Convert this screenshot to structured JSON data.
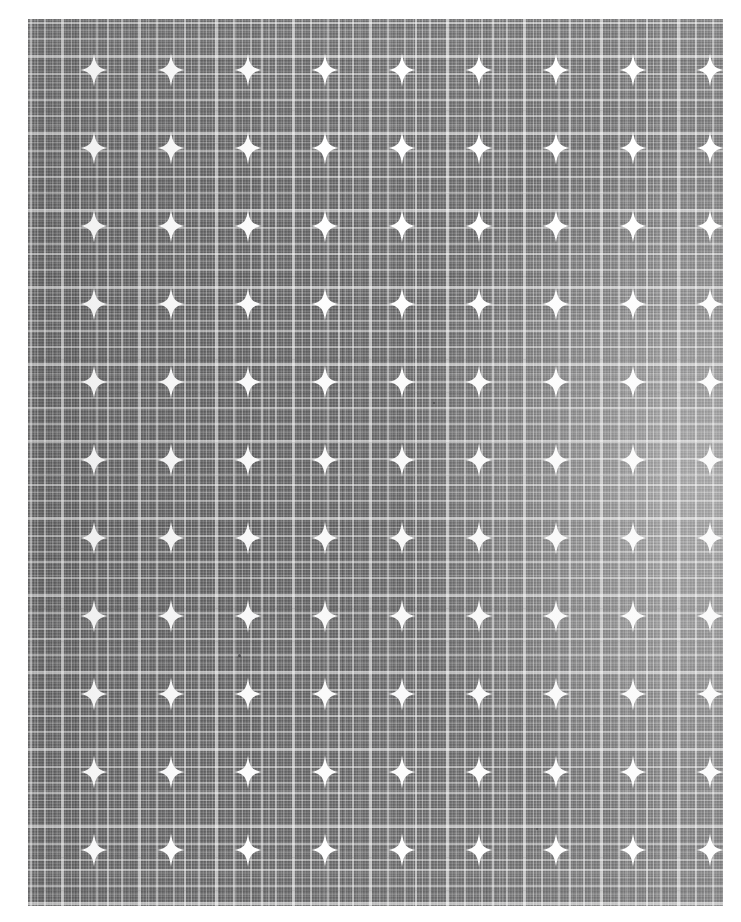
{
  "image": {
    "subject": "plaid fabric swatch with star motifs",
    "canvas_width": 741,
    "canvas_height": 922,
    "background_color": "#ffffff"
  },
  "swatch": {
    "label": "fabric-swatch",
    "left": 28,
    "top": 19,
    "width": 695,
    "height": 887,
    "base_color": "#6f6f70",
    "thread_light_color": "#e0e0e0",
    "thread_dark_color": "#5a5a5c",
    "motif_color": "#ffffff"
  },
  "pattern": {
    "weave": "plaid",
    "motif": "four-point-star",
    "motif_columns": 9,
    "motif_rows": 11,
    "motif_spacing_x": 77,
    "motif_spacing_y": 78,
    "motif_origin_x": 94,
    "motif_origin_y": 70,
    "motif_width": 28,
    "motif_height": 33,
    "plaid_repeat_x": 77,
    "plaid_repeat_y": 77
  },
  "lighting": {
    "highlight_side": "right",
    "vignette": "soft",
    "highlight_color": "#ffffff"
  },
  "flecks": [
    {
      "x": 238,
      "y": 654,
      "size": 3
    },
    {
      "x": 536,
      "y": 828,
      "size": 2
    },
    {
      "x": 433,
      "y": 402,
      "size": 2
    }
  ]
}
